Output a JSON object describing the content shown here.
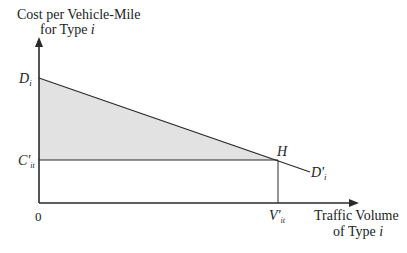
{
  "diagram": {
    "y_axis_label_line1": "Cost per Vehicle-Mile",
    "y_axis_label_line2_prefix": "for Type ",
    "y_axis_label_line2_var": "i",
    "x_axis_label_line1": "Traffic Volume",
    "x_axis_label_line2_prefix": "of Type ",
    "x_axis_label_line2_var": "i",
    "origin_label": "0",
    "demand_intercept_label": "D",
    "demand_intercept_sub": "i",
    "cost_level_label": "C'",
    "cost_level_sub": "it",
    "intersection_label": "H",
    "demand_curve_label": "D'",
    "demand_curve_sub": "i",
    "volume_label": "V'",
    "volume_sub": "it",
    "colors": {
      "line": "#2a2a2a",
      "shaded_area": "#e2e2e2",
      "background": "#ffffff"
    }
  }
}
